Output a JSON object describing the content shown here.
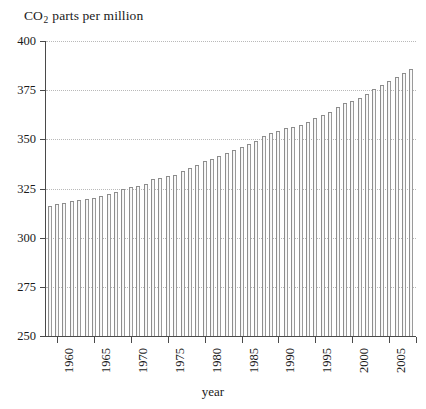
{
  "chart_data": {
    "type": "bar",
    "title": "CO2 parts per million",
    "title_main": "CO",
    "title_sub": "2",
    "title_rest": " parts per million",
    "xlabel": "year",
    "ylabel": "",
    "ylim": [
      250,
      400
    ],
    "ytick_values": [
      400,
      375,
      350,
      325,
      300,
      275,
      250
    ],
    "ytick_labels": [
      "400",
      "375",
      "350",
      "325",
      "300",
      "275",
      "250"
    ],
    "grid": true,
    "legend": "none",
    "xtick_labels": [
      "1960",
      "1965",
      "1970",
      "1975",
      "1980",
      "1985",
      "1990",
      "1995",
      "2000",
      "2005"
    ],
    "xtick_years": [
      1960,
      1965,
      1970,
      1975,
      1980,
      1985,
      1990,
      1995,
      2000,
      2005
    ],
    "xlim": [
      1959,
      2008
    ],
    "categories": [
      1959,
      1960,
      1961,
      1962,
      1963,
      1964,
      1965,
      1966,
      1967,
      1968,
      1969,
      1970,
      1971,
      1972,
      1973,
      1974,
      1975,
      1976,
      1977,
      1978,
      1979,
      1980,
      1981,
      1982,
      1983,
      1984,
      1985,
      1986,
      1987,
      1988,
      1989,
      1990,
      1991,
      1992,
      1993,
      1994,
      1995,
      1996,
      1997,
      1998,
      1999,
      2000,
      2001,
      2002,
      2003,
      2004,
      2005,
      2006,
      2007,
      2008
    ],
    "values": [
      315.97,
      316.91,
      317.64,
      318.45,
      318.99,
      319.62,
      320.04,
      321.38,
      322.16,
      323.04,
      324.62,
      325.68,
      326.32,
      327.45,
      329.68,
      330.18,
      331.11,
      332.04,
      333.83,
      335.4,
      336.84,
      338.75,
      340.11,
      341.45,
      343.05,
      344.65,
      346.12,
      347.42,
      349.19,
      351.57,
      353.12,
      354.39,
      355.61,
      356.45,
      357.1,
      358.83,
      360.82,
      362.61,
      363.73,
      366.7,
      368.38,
      369.55,
      371.14,
      373.28,
      375.8,
      377.52,
      379.8,
      381.9,
      383.79,
      385.6
    ],
    "bar_color": "#9a9a9a",
    "grid_color": "#b9b9b9",
    "axis_color": "#4a4a4a",
    "background": "#ffffff"
  }
}
